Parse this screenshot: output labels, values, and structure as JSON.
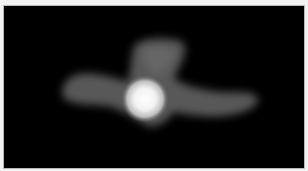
{
  "image": {
    "kind": "grayscale fluorescence micrograph",
    "background_color": "#000000",
    "cell_body_color": "#5a5a5a",
    "bright_spot_color": "#ffffff",
    "border_color": "#b8b8b8"
  }
}
